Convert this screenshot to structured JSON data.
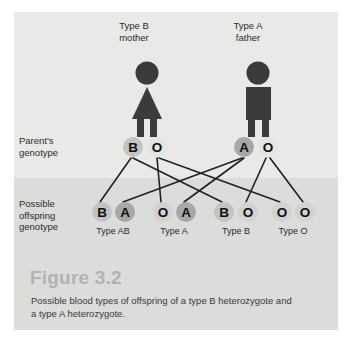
{
  "figure": {
    "title": "Figure 3.2",
    "caption": "Possible blood types of offspring of a type B heterozygote and a type A heterozygote.",
    "background_color": "#e9e9e7",
    "lower_band_color": "#dcdcda",
    "title_color": "#b2b2b0",
    "caption_color": "#3a3a3a"
  },
  "parents": {
    "mother": {
      "heading": "Type B\nmother",
      "icon": "female-pictogram",
      "alleles": [
        "B",
        "O"
      ]
    },
    "father": {
      "heading": "Type A\nfather",
      "icon": "male-pictogram",
      "alleles": [
        "A",
        "O"
      ]
    }
  },
  "rows": {
    "parent_genotype_label": "Parent's\ngenotype",
    "offspring_genotype_label": "Possible\noffspring\ngenotype"
  },
  "parent_alleles": [
    {
      "letter": "B",
      "x": 133,
      "y": 147,
      "shade": "B",
      "parent": "mother"
    },
    {
      "letter": "O",
      "x": 157,
      "y": 147,
      "shade": "O",
      "parent": "mother"
    },
    {
      "letter": "A",
      "x": 244,
      "y": 147,
      "shade": "A",
      "parent": "father"
    },
    {
      "letter": "O",
      "x": 268,
      "y": 147,
      "shade": "O",
      "parent": "father"
    }
  ],
  "offspring": [
    {
      "type_label": "Type AB",
      "alleles": [
        {
          "letter": "B",
          "x": 102,
          "shade": "B"
        },
        {
          "letter": "A",
          "x": 125,
          "shade": "A"
        }
      ],
      "label_x": 113
    },
    {
      "type_label": "Type A",
      "alleles": [
        {
          "letter": "O",
          "x": 163,
          "shade": "O-low"
        },
        {
          "letter": "A",
          "x": 186,
          "shade": "A"
        }
      ],
      "label_x": 174
    },
    {
      "type_label": "Type B",
      "alleles": [
        {
          "letter": "B",
          "x": 224,
          "shade": "B"
        },
        {
          "letter": "O",
          "x": 248,
          "shade": "O-low"
        }
      ],
      "label_x": 236
    },
    {
      "type_label": "Type O",
      "alleles": [
        {
          "letter": "O",
          "x": 282,
          "shade": "O-low"
        },
        {
          "letter": "O",
          "x": 305,
          "shade": "O-low"
        }
      ],
      "label_x": 293
    }
  ],
  "connectors": {
    "color": "#222222",
    "width": 1.6,
    "edges": [
      {
        "from": "mother-B",
        "to": "offspring-1-B"
      },
      {
        "from": "mother-B",
        "to": "offspring-3-B"
      },
      {
        "from": "mother-O",
        "to": "offspring-2-O"
      },
      {
        "from": "mother-O",
        "to": "offspring-4-O"
      },
      {
        "from": "father-A",
        "to": "offspring-1-A"
      },
      {
        "from": "father-A",
        "to": "offspring-2-A"
      },
      {
        "from": "father-O",
        "to": "offspring-3-O"
      },
      {
        "from": "father-O",
        "to": "offspring-4-O2"
      }
    ]
  }
}
